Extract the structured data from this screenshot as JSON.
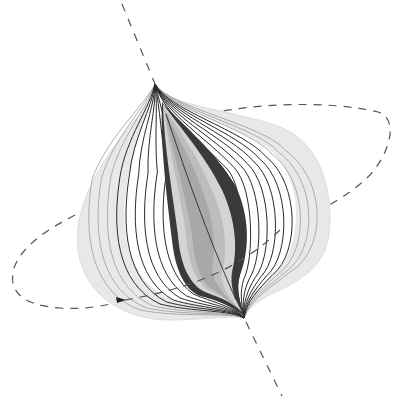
{
  "figure": {
    "colors": {
      "background": "#ffffff",
      "outer_envelope": "#e8e8e8",
      "outer_envelope_edge": "#dcdcdc",
      "contour_line": "#2a2a2a",
      "faint_contour_line": "#9a9a9a",
      "dark_band": "#3a3a3a",
      "mid_band": "#bdbdbd",
      "light_band": "#d4d4d4",
      "core_fill": "#a8a8a8",
      "inner_core_fill": "#9a9a9a",
      "dashed_line": "#555555",
      "arrow": "#222222"
    },
    "axis": {
      "style": "dashed",
      "label": ""
    },
    "orbit": {
      "style": "dashed",
      "direction_marker": "arrow-right",
      "label": ""
    },
    "outer_contour_count": 10,
    "inner_shaded_layers": 4
  }
}
